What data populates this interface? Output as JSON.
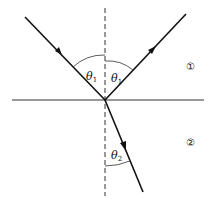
{
  "diagram": {
    "angles": {
      "incident": {
        "symbol": "θ",
        "subscript": "1"
      },
      "reflected": {
        "symbol": "θ",
        "subscript": "1"
      },
      "refracted": {
        "symbol": "θ",
        "subscript": "2"
      }
    },
    "media": {
      "upper": "①",
      "lower": "②"
    },
    "colors": {
      "line": "#111111",
      "background": "#ffffff"
    }
  }
}
